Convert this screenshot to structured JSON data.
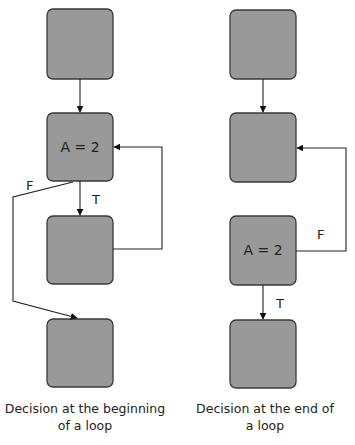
{
  "colors": {
    "box_fill": "#999999",
    "box_stroke": "#3a3a3a",
    "line": "#222222",
    "background": "#ffffff"
  },
  "left_diagram": {
    "boxes": [
      {
        "id": "L1",
        "text": ""
      },
      {
        "id": "L2",
        "text": "A = 2"
      },
      {
        "id": "L3",
        "text": ""
      },
      {
        "id": "L4",
        "text": ""
      }
    ],
    "edges": [
      {
        "from": "L1",
        "to": "L2",
        "label": ""
      },
      {
        "from": "L2",
        "to": "L3",
        "label": "T"
      },
      {
        "from": "L3",
        "to": "L2",
        "label": ""
      },
      {
        "from": "L2",
        "to": "L4",
        "label": "F"
      }
    ],
    "true_label": "T",
    "false_label": "F",
    "caption_line1": "Decision at the beginning",
    "caption_line2": "of a loop"
  },
  "right_diagram": {
    "boxes": [
      {
        "id": "R1",
        "text": ""
      },
      {
        "id": "R2",
        "text": ""
      },
      {
        "id": "R3",
        "text": "A = 2"
      },
      {
        "id": "R4",
        "text": ""
      }
    ],
    "edges": [
      {
        "from": "R1",
        "to": "R2",
        "label": ""
      },
      {
        "from": "R3",
        "to": "R2",
        "label": "F"
      },
      {
        "from": "R3",
        "to": "R4",
        "label": "T"
      }
    ],
    "true_label": "T",
    "false_label": "F",
    "caption_line1": "Decision at the end of",
    "caption_line2": "a loop"
  }
}
